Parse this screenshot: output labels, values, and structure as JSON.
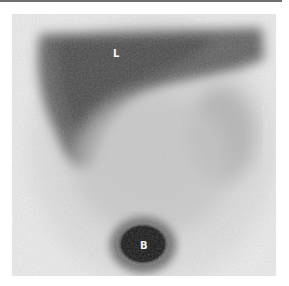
{
  "figure": {
    "type": "scintigraphy-grayscale",
    "labels": [
      {
        "id": "L",
        "text": "L",
        "x": 101,
        "y": 35
      },
      {
        "id": "B",
        "text": "B",
        "x": 128,
        "y": 227
      }
    ],
    "colors": {
      "background": "#ececec",
      "organ_dark": "#555555",
      "blob_core": "#1a1a1a",
      "top_rule": "#6e6e6e"
    }
  }
}
